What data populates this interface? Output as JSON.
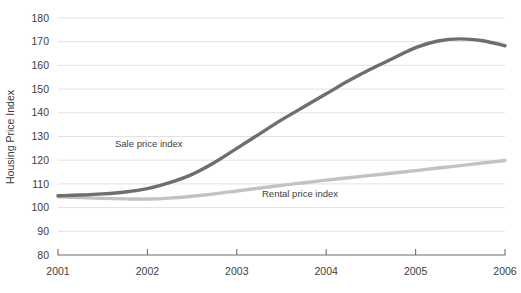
{
  "chart_data": {
    "type": "line",
    "title": "",
    "xlabel": "",
    "ylabel": "Housing Price Index",
    "xlim": [
      2001,
      2006
    ],
    "ylim": [
      80,
      180
    ],
    "grid": true,
    "legend_position": "inline-annotation",
    "x_ticks": [
      "2001",
      "2002",
      "2003",
      "2004",
      "2005",
      "2006"
    ],
    "y_ticks": [
      "80",
      "90",
      "100",
      "110",
      "120",
      "130",
      "140",
      "150",
      "160",
      "170",
      "180"
    ],
    "x": [
      2001,
      2001.25,
      2001.5,
      2001.75,
      2002,
      2002.25,
      2002.5,
      2002.75,
      2003,
      2003.25,
      2003.5,
      2003.75,
      2004,
      2004.25,
      2004.5,
      2004.75,
      2005,
      2005.25,
      2005.5,
      2005.75,
      2006
    ],
    "series": [
      {
        "name": "Sale price index",
        "color": "#6e6e6e",
        "values": [
          105.0,
          105.3,
          105.8,
          106.6,
          108.0,
          110.5,
          114.0,
          119.0,
          125.0,
          131.0,
          137.0,
          142.5,
          148.0,
          153.5,
          158.5,
          163.0,
          167.5,
          170.3,
          171.2,
          170.4,
          168.3
        ],
        "annotation": "Sale price index",
        "annotation_x": 115,
        "annotation_y": 147
      },
      {
        "name": "Rental price index",
        "color": "#c2c2c2",
        "values": [
          104.6,
          104.2,
          103.9,
          103.7,
          103.6,
          104.0,
          104.8,
          105.8,
          107.0,
          108.2,
          109.4,
          110.5,
          111.6,
          112.6,
          113.6,
          114.6,
          115.6,
          116.7,
          117.7,
          118.8,
          119.9
        ],
        "annotation": "Rental price index",
        "annotation_x": 262,
        "annotation_y": 197
      }
    ]
  },
  "plot_geometry": {
    "left": 58,
    "right": 505,
    "top": 18,
    "bottom": 255
  }
}
